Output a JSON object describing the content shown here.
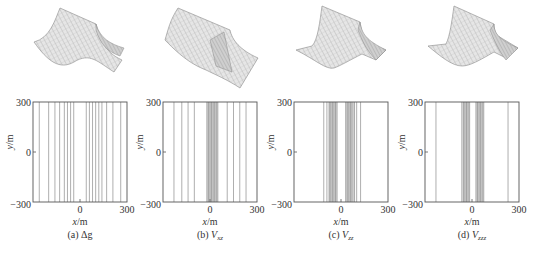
{
  "figure": {
    "panels": [
      {
        "id": "a",
        "caption_prefix": "(a) ",
        "caption_symbol": "Δg",
        "caption_sub": ""
      },
      {
        "id": "b",
        "caption_prefix": "(b) ",
        "caption_symbol": "V",
        "caption_sub": "xz"
      },
      {
        "id": "c",
        "caption_prefix": "(c) ",
        "caption_symbol": "V",
        "caption_sub": "zz"
      },
      {
        "id": "d",
        "caption_prefix": "(d) ",
        "caption_symbol": "V",
        "caption_sub": "zzz"
      }
    ],
    "xlabel": "x/m",
    "ylabel": "y/m",
    "xticks": [
      "−300",
      "0",
      "300"
    ],
    "yticks": [
      "300",
      "0",
      "−300"
    ]
  },
  "chart_data": [
    {
      "type": "contour",
      "title": "(a) Δg",
      "xlabel": "x/m",
      "ylabel": "y/m",
      "xlim": [
        -300,
        300
      ],
      "ylim": [
        -300,
        300
      ],
      "xticks": [
        0,
        300
      ],
      "yticks": [
        -300,
        0,
        300
      ],
      "contour_lines_x": [
        -260,
        -200,
        -160,
        -130,
        -100,
        -80,
        -60,
        -40,
        40,
        60,
        80,
        100,
        120,
        140,
        170,
        210,
        260
      ],
      "surface_shape": "single ridge along y"
    },
    {
      "type": "contour",
      "title": "(b) Vxz",
      "xlabel": "x/m",
      "ylabel": "y/m",
      "xlim": [
        -300,
        300
      ],
      "ylim": [
        -300,
        300
      ],
      "xticks": [
        0,
        300
      ],
      "yticks": [
        -300,
        0,
        300
      ],
      "contour_lines_x": [
        -230,
        -180,
        -140,
        -100,
        -20,
        -10,
        0,
        10,
        20,
        30,
        40,
        50,
        110,
        150,
        190,
        230
      ],
      "dense_band_x": [
        -20,
        50
      ],
      "surface_shape": "antisymmetric ridge/trough along y"
    },
    {
      "type": "contour",
      "title": "(c) Vzz",
      "xlabel": "x/m",
      "ylabel": "y/m",
      "xlim": [
        -300,
        300
      ],
      "ylim": [
        -300,
        300
      ],
      "xticks": [
        0,
        300
      ],
      "yticks": [
        -300,
        0,
        300
      ],
      "contour_lines_x": [
        -110,
        -90,
        -75,
        -65,
        -55,
        -45,
        -35,
        -25,
        30,
        40,
        50,
        60,
        70,
        85,
        100,
        125
      ],
      "dense_band_x": [
        [
          -80,
          -25
        ],
        [
          30,
          90
        ]
      ],
      "surface_shape": "central ridge with side troughs"
    },
    {
      "type": "contour",
      "title": "(d) Vzzz",
      "xlabel": "x/m",
      "ylabel": "y/m",
      "xlim": [
        -300,
        300
      ],
      "ylim": [
        -300,
        300
      ],
      "xticks": [
        0,
        300
      ],
      "yticks": [
        -300,
        0,
        300
      ],
      "contour_lines_x": [
        -230,
        -65,
        -55,
        -45,
        -35,
        -25,
        -15,
        25,
        35,
        45,
        55,
        65,
        75,
        230
      ],
      "dense_band_x": [
        [
          -60,
          -15
        ],
        [
          25,
          75
        ]
      ],
      "surface_shape": "sharp central ridge with side troughs"
    }
  ]
}
